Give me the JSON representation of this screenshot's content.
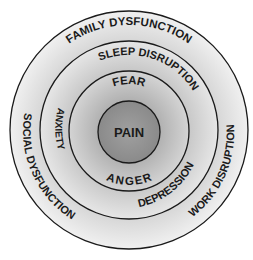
{
  "diagram": {
    "type": "concentric-circles",
    "center": {
      "label": "PAIN"
    },
    "rings": [
      {
        "level": 1,
        "labels": [
          "FEAR",
          "ANGER"
        ]
      },
      {
        "level": 2,
        "labels": [
          "SLEEP DISRUPTION",
          "ANXIETY",
          "DEPRESSION"
        ]
      },
      {
        "level": 3,
        "labels": [
          "FAMILY DYSFUNCTION",
          "SOCIAL DYSFUNCTION",
          "WORK DISRUPTION"
        ]
      }
    ],
    "colors": {
      "outline": "#1a1a1a",
      "fill_light": "#f2f2f2",
      "fill_dark": "#8c8c8c",
      "text": "#1a1a1a"
    }
  }
}
